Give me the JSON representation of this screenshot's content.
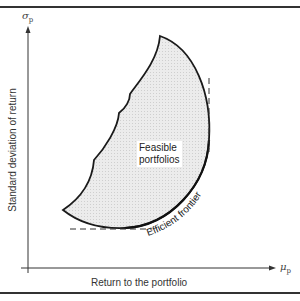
{
  "diagram": {
    "type": "feasible-set / efficient-frontier",
    "y_axis": {
      "symbol": "σ",
      "subscript": "p",
      "label": "Standard deviation of return"
    },
    "x_axis": {
      "symbol": "μ",
      "subscript": "p",
      "label": "Return to the portfolio"
    },
    "regions": [
      {
        "label_line1": "Feasible",
        "label_line2": "portfolios"
      }
    ],
    "curves": [
      {
        "label": "Efficient frontier"
      }
    ],
    "colors": {
      "line": "#222222",
      "fill": "#e6e6e6",
      "dash": "#333333"
    }
  }
}
